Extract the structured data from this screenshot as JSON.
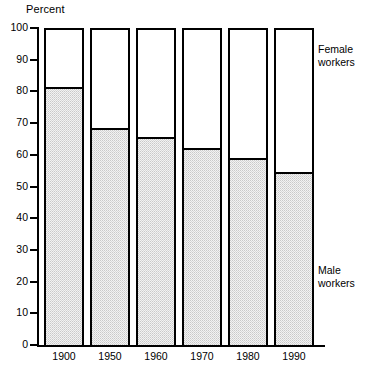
{
  "axis_title": "Percent",
  "legend": {
    "female": {
      "line1": "Female",
      "line2": "workers"
    },
    "male": {
      "line1": "Male",
      "line2": "workers"
    }
  },
  "y_ticks": [
    "100",
    "90",
    "80",
    "70",
    "60",
    "50",
    "40",
    "30",
    "20",
    "10",
    "0"
  ],
  "x_ticks": [
    "1900",
    "1950",
    "1960",
    "1970",
    "1980",
    "1990"
  ],
  "chart_data": {
    "type": "bar",
    "stacked": true,
    "stack_total": 100,
    "title": "",
    "subtitle": "",
    "xlabel": "",
    "ylabel": "Percent",
    "ylim": [
      0,
      100
    ],
    "ytick_step": 10,
    "grid": false,
    "legend_position": "right",
    "categories": [
      "1900",
      "1950",
      "1960",
      "1970",
      "1980",
      "1990"
    ],
    "series": [
      {
        "name": "Male workers",
        "fill": "stipple-light-gray",
        "color": "#f2f2f2",
        "values": [
          81.5,
          68.5,
          65.5,
          62.0,
          59.0,
          54.5
        ]
      },
      {
        "name": "Female workers",
        "fill": "white",
        "color": "#ffffff",
        "values": [
          18.5,
          31.5,
          34.5,
          38.0,
          41.0,
          45.5
        ]
      }
    ],
    "annotations": [
      {
        "text": "Female workers",
        "position": "right-top"
      },
      {
        "text": "Male workers",
        "position": "right-bottom"
      }
    ]
  }
}
